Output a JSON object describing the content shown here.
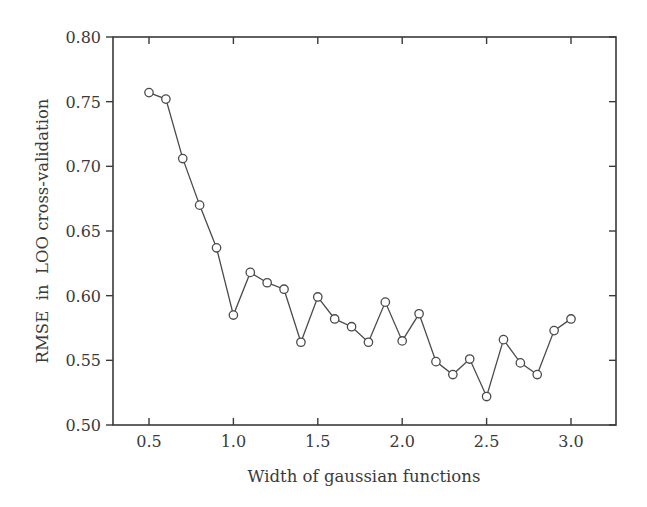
{
  "chart_data": {
    "type": "line",
    "title": "",
    "xlabel": "Width of gaussian functions",
    "ylabel": "RMSE  in  LOO cross-validation",
    "xlim": [
      0.29,
      3.26
    ],
    "ylim": [
      0.5,
      0.8
    ],
    "xticks": [
      0.5,
      1.0,
      1.5,
      2.0,
      2.5,
      3.0
    ],
    "xtick_labels": [
      "0.5",
      "1.0",
      "1.5",
      "2.0",
      "2.5",
      "3.0"
    ],
    "yticks": [
      0.5,
      0.55,
      0.6,
      0.65,
      0.7,
      0.75,
      0.8
    ],
    "ytick_labels": [
      "0.50",
      "0.55",
      "0.60",
      "0.65",
      "0.70",
      "0.75",
      "0.80"
    ],
    "grid": false,
    "legend": null,
    "marker": "open-circle",
    "series": [
      {
        "name": "RMSE",
        "x": [
          0.5,
          0.6,
          0.7,
          0.8,
          0.9,
          1.0,
          1.1,
          1.2,
          1.3,
          1.4,
          1.5,
          1.6,
          1.7,
          1.8,
          1.9,
          2.0,
          2.1,
          2.2,
          2.3,
          2.4,
          2.5,
          2.6,
          2.7,
          2.8,
          2.9,
          3.0
        ],
        "y": [
          0.757,
          0.752,
          0.706,
          0.67,
          0.637,
          0.585,
          0.618,
          0.61,
          0.605,
          0.564,
          0.599,
          0.582,
          0.576,
          0.564,
          0.595,
          0.565,
          0.586,
          0.549,
          0.539,
          0.551,
          0.522,
          0.566,
          0.548,
          0.539,
          0.573,
          0.582
        ]
      }
    ]
  },
  "colors": {
    "line": "#4a4a4a",
    "axis": "#3a3a3a",
    "marker_fill": "#ffffff"
  }
}
